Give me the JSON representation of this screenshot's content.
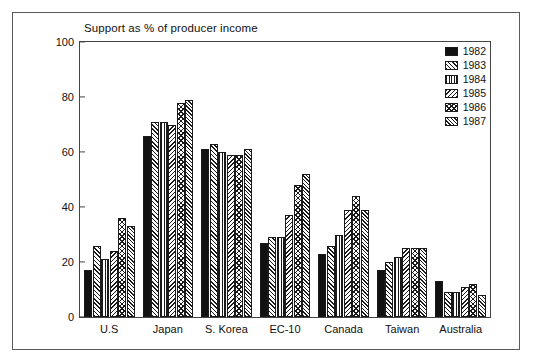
{
  "chart_data": {
    "type": "bar",
    "title": "Support as % of producer income",
    "xlabel": "",
    "ylabel": "",
    "ylim": [
      0,
      100
    ],
    "yticks": [
      0,
      20,
      40,
      60,
      80,
      100
    ],
    "grid": false,
    "legend_position": "top-right",
    "categories": [
      "U.S",
      "Japan",
      "S. Korea",
      "EC-10",
      "Canada",
      "Taiwan",
      "Australia"
    ],
    "series": [
      {
        "name": "1982",
        "pattern": "solid-black",
        "values": [
          17,
          66,
          61,
          27,
          23,
          17,
          13
        ]
      },
      {
        "name": "1983",
        "pattern": "diagonal-right",
        "values": [
          26,
          71,
          63,
          29,
          26,
          20,
          9
        ]
      },
      {
        "name": "1984",
        "pattern": "vertical-lines",
        "values": [
          21,
          71,
          60,
          29,
          30,
          22,
          9
        ]
      },
      {
        "name": "1985",
        "pattern": "diagonal-left",
        "values": [
          24,
          70,
          59,
          37,
          39,
          25,
          11
        ]
      },
      {
        "name": "1986",
        "pattern": "cross-hatch",
        "values": [
          36,
          78,
          59,
          48,
          44,
          25,
          12
        ]
      },
      {
        "name": "1987",
        "pattern": "diagonal-right-dense",
        "values": [
          33,
          79,
          61,
          52,
          39,
          25,
          8
        ]
      }
    ]
  },
  "colors": {
    "frame": "#5a5a5a",
    "axis": "#444444",
    "bar_outline": "#1a1a1a",
    "text": "#111111",
    "background": "#ffffff"
  }
}
